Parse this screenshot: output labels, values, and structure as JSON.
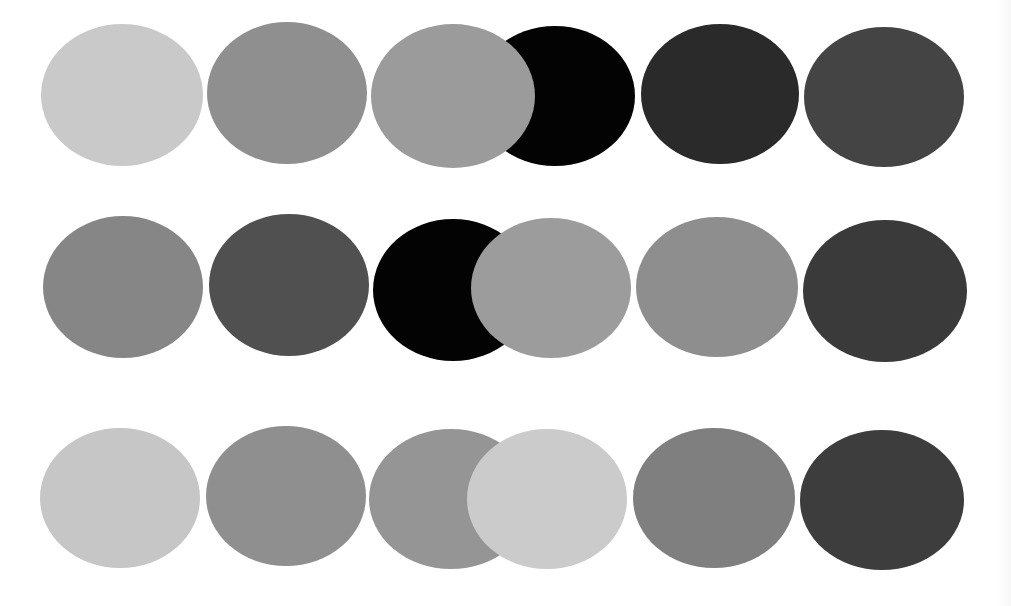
{
  "figure": {
    "background": "#ffffff",
    "rows": 3,
    "columns": 6,
    "circles": [
      {
        "id": "r1c1",
        "row": 1,
        "col": 1,
        "cx": 122,
        "cy": 95,
        "rx": 81,
        "ry": 71,
        "color": "#c9c9c9",
        "z": 1
      },
      {
        "id": "r1c2",
        "row": 1,
        "col": 2,
        "cx": 287,
        "cy": 93,
        "rx": 80,
        "ry": 71,
        "color": "#8f8f8f",
        "z": 1
      },
      {
        "id": "r1c4",
        "row": 1,
        "col": 4,
        "cx": 555,
        "cy": 96,
        "rx": 80,
        "ry": 70,
        "color": "#030303",
        "z": 1
      },
      {
        "id": "r1c3",
        "row": 1,
        "col": 3,
        "cx": 453,
        "cy": 96,
        "rx": 82,
        "ry": 72,
        "color": "#9b9b9b",
        "z": 2
      },
      {
        "id": "r1c5",
        "row": 1,
        "col": 5,
        "cx": 720,
        "cy": 94,
        "rx": 79,
        "ry": 70,
        "color": "#2a2a2a",
        "z": 1
      },
      {
        "id": "r1c6",
        "row": 1,
        "col": 6,
        "cx": 884,
        "cy": 97,
        "rx": 80,
        "ry": 70,
        "color": "#444444",
        "z": 1
      },
      {
        "id": "r2c1",
        "row": 2,
        "col": 1,
        "cx": 123,
        "cy": 287,
        "rx": 80,
        "ry": 71,
        "color": "#868686",
        "z": 1
      },
      {
        "id": "r2c2",
        "row": 2,
        "col": 2,
        "cx": 289,
        "cy": 285,
        "rx": 80,
        "ry": 71,
        "color": "#505050",
        "z": 1
      },
      {
        "id": "r2c3",
        "row": 2,
        "col": 3,
        "cx": 453,
        "cy": 290,
        "rx": 80,
        "ry": 71,
        "color": "#030303",
        "z": 1
      },
      {
        "id": "r2c4",
        "row": 2,
        "col": 4,
        "cx": 551,
        "cy": 288,
        "rx": 80,
        "ry": 70,
        "color": "#9c9c9c",
        "z": 2
      },
      {
        "id": "r2c5",
        "row": 2,
        "col": 5,
        "cx": 717,
        "cy": 287,
        "rx": 81,
        "ry": 70,
        "color": "#8e8e8e",
        "z": 1
      },
      {
        "id": "r2c6",
        "row": 2,
        "col": 6,
        "cx": 885,
        "cy": 291,
        "rx": 82,
        "ry": 71,
        "color": "#3a3a3a",
        "z": 1
      },
      {
        "id": "r3c1",
        "row": 3,
        "col": 1,
        "cx": 120,
        "cy": 498,
        "rx": 80,
        "ry": 70,
        "color": "#c6c6c6",
        "z": 1
      },
      {
        "id": "r3c2",
        "row": 3,
        "col": 2,
        "cx": 286,
        "cy": 496,
        "rx": 80,
        "ry": 70,
        "color": "#8f8f8f",
        "z": 1
      },
      {
        "id": "r3c3",
        "row": 3,
        "col": 3,
        "cx": 451,
        "cy": 499,
        "rx": 82,
        "ry": 70,
        "color": "#959595",
        "z": 1
      },
      {
        "id": "r3c4",
        "row": 3,
        "col": 4,
        "cx": 547,
        "cy": 499,
        "rx": 80,
        "ry": 70,
        "color": "#cbcbcb",
        "z": 2
      },
      {
        "id": "r3c5",
        "row": 3,
        "col": 5,
        "cx": 714,
        "cy": 498,
        "rx": 81,
        "ry": 70,
        "color": "#7f7f7f",
        "z": 1
      },
      {
        "id": "r3c6",
        "row": 3,
        "col": 6,
        "cx": 882,
        "cy": 500,
        "rx": 82,
        "ry": 70,
        "color": "#3d3d3d",
        "z": 1
      }
    ]
  }
}
